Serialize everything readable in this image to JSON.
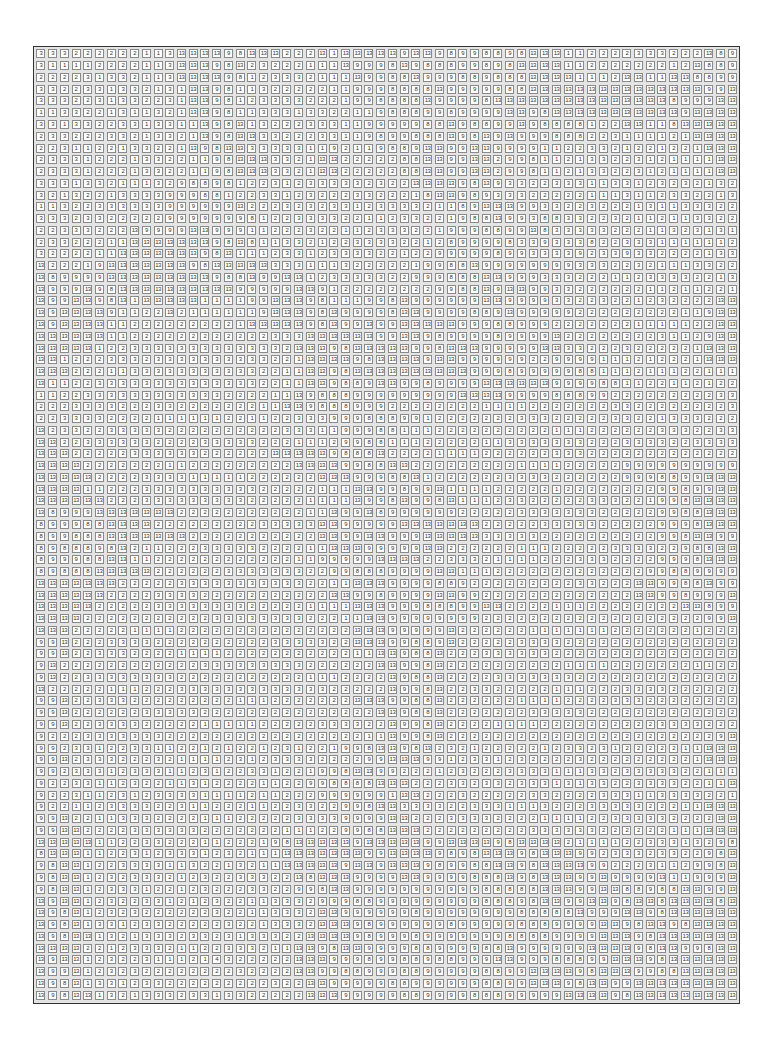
{
  "puzzle": {
    "type": "paint-by-number",
    "columns": 60,
    "rows": 81,
    "palette_numbers": [
      "1",
      "2",
      "3",
      "8",
      "9",
      "13"
    ],
    "grid_rows": [
      "3 3 3 2 2 2 2 2 2 1 1 3 13 13 13 13 9 8 13 13 13 2 2 2 13 1 13 13 13 13 13 9 13 13 9 8 9 9 8 8 9 8 13 13 13 1 1 2 2 2 2 3 3 3 2 2 2 13 8 9",
      "3 1 1 1 1 2 2 2 2 1 1 3 13 13 13 9 8 13 2 3 2 2 2 1 1 1 13 9 9 9 8 13 9 8 8 8 9 9 8 9 8 13 13 13 13 1 1 2 2 2 2 2 2 2 1 2 13 8 8 9",
      "2 2 2 2 3 1 3 3 2 1 1 3 13 13 13 13 9 8 1 2 3 3 3 2 1 1 1 13 9 9 8 8 13 9 9 9 8 8 9 8 8 8 13 13 13 13 1 1 1 2 13 13 1 1 13 13 8 8 9 9",
      "3 3 2 2 3 3 1 3 3 2 1 3 1 13 13 9 8 1 1 3 2 2 2 2 2 1 1 9 9 9 8 8 8 8 13 9 9 9 9 9 8 8 13 13 13 13 13 13 13 13 13 13 13 13 13 13 13 9 9 13",
      "3 3 3 2 2 3 1 3 3 2 2 3 1 13 13 9 8 1 2 3 3 3 3 2 2 2 1 9 9 8 8 8 8 13 9 9 9 9 8 13 13 13 13 13 13 13 13 13 13 13 13 13 13 13 8 9 9 9 13 13",
      "1 1 3 3 2 2 1 3 1 1 3 2 1 13 13 9 8 1 1 3 3 3 1 3 3 2 2 1 1 9 8 8 8 9 9 8 9 9 9 9 13 13 9 8 13 13 13 13 13 13 13 13 13 13 13 9 13 13 13 13",
      "3 3 1 3 3 2 2 3 3 1 3 3 1 1 13 9 8 13 1 3 2 2 2 3 3 3 1 1 9 9 9 9 9 8 8 13 9 8 8 9 9 13 9 8 8 8 8 1 2 2 13 13 1 1 8 13 13 13 13 13",
      "2 3 3 2 2 2 3 3 2 1 3 3 2 1 13 9 8 13 13 3 3 2 2 2 3 3 1 1 9 8 9 9 8 8 8 13 9 8 13 9 13 9 9 9 8 8 8 2 2 3 1 1 1 1 2 1 13 13 13 13",
      "2 2 3 1 1 2 2 1 3 3 2 2 1 13 9 8 13 13 3 3 3 3 3 1 1 9 2 1 1 9 8 8 9 13 13 9 9 13 13 9 9 9 9 1 1 2 2 3 3 2 1 2 2 1 2 2 1 13 13 13",
      "2 3 3 3 1 2 2 2 1 3 3 2 2 1 1 9 8 13 13 13 3 3 2 1 13 13 2 2 2 2 2 8 8 13 13 9 9 13 13 2 9 9 8 1 1 2 1 3 3 2 2 3 1 2 1 1 1 1 13 13",
      "2 3 3 3 1 2 2 2 1 3 3 2 2 1 1 9 8 13 13 13 3 3 2 1 13 13 2 2 2 2 2 8 8 13 13 9 9 13 13 2 9 9 8 1 1 2 1 3 3 2 2 3 1 2 1 1 1 1 13 13",
      "3 3 3 1 3 3 2 1 1 1 3 2 9 8 8 9 8 1 2 2 3 1 2 3 3 3 3 3 2 3 2 2 13 13 13 13 9 8 13 9 3 3 2 2 3 3 3 1 1 3 3 1 2 3 2 3 2 1 3 2",
      "3 2 1 3 2 2 1 3 3 3 3 9 9 9 8 8 1 2 2 3 3 1 2 3 2 2 2 3 3 2 2 2 1 8 13 13 9 8 9 3 3 3 2 2 2 2 2 1 1 1 3 1 1 2 3 3 2 2 1 3",
      "1 1 3 2 2 3 3 3 3 3 3 9 9 9 9 9 9 13 2 2 2 3 2 3 2 3 3 1 2 3 3 3 3 2 1 1 8 9 13 13 13 9 9 3 3 2 2 3 2 2 2 1 3 1 1 3 3 3 2 2",
      "3 3 3 2 3 3 2 2 2 2 2 9 9 9 9 9 9 9 8 1 2 2 3 3 3 3 2 2 1 1 2 3 3 2 2 1 9 8 8 13 9 9 3 8 8 3 3 2 2 3 2 1 1 2 1 1 3 3 2 2",
      "2 2 3 3 3 2 2 2 13 9 9 9 9 13 13 9 9 9 1 1 2 2 2 3 2 2 1 1 2 3 3 3 2 2 1 9 9 9 8 8 9 9 13 8 3 3 3 3 3 2 2 2 1 1 3 2 3 1 3 1",
      "2 3 3 2 2 2 1 1 13 13 13 13 13 13 13 9 8 13 8 1 1 3 3 2 1 2 2 3 3 3 3 2 2 1 2 8 9 9 9 9 8 3 3 9 3 3 3 8 2 2 3 3 3 1 1 1 1 1 1 2",
      "3 2 2 2 2 1 1 13 13 13 13 13 13 13 9 8 13 1 1 1 2 3 3 1 2 3 3 3 3 2 2 1 2 2 9 9 9 9 9 8 9 9 3 3 3 3 9 2 3 3 9 3 3 2 2 2 2 1 3 3",
      "13 2 2 2 1 9 13 13 13 13 13 13 13 9 8 13 13 13 13 13 3 3 3 1 1 1 3 2 2 2 2 2 1 9 9 8 8 13 9 9 9 9 9 9 9 9 3 3 3 2 2 3 2 1 1 1 3 3 2 2",
      "13 8 9 9 9 9 13 13 13 13 13 13 13 13 13 9 8 8 13 9 9 13 13 1 2 3 3 3 3 3 2 2 9 9 9 8 8 8 13 13 9 9 9 3 3 3 2 2 2 1 1 2 3 3 3 3 2 2 1 3",
      "13 9 9 9 13 9 8 13 13 13 13 13 13 13 13 13 13 9 9 9 9 9 13 13 9 1 2 2 2 2 2 2 2 2 9 9 8 8 13 9 13 13 9 9 3 3 2 2 2 2 2 2 1 1 2 1 1 2 2 1",
      "13 9 9 13 13 9 8 13 1 13 13 13 13 13 1 1 1 1 9 9 13 13 13 9 8 1 1 1 9 9 8 13 9 9 9 9 9 9 13 13 9 9 9 9 3 3 2 2 3 2 2 1 2 3 2 2 2 2 13 13",
      "13 9 13 13 13 13 9 1 1 2 2 13 2 1 1 1 1 1 1 9 13 13 13 9 8 13 9 9 9 9 8 13 13 9 9 9 9 8 8 9 13 9 9 9 9 9 2 2 2 2 2 2 2 2 2 1 1 9 13 13",
      "13 9 13 13 13 13 1 1 2 2 2 2 2 2 2 2 2 1 13 13 13 13 13 9 8 13 9 9 13 9 9 13 13 13 13 13 9 9 9 8 8 9 9 9 2 2 2 2 2 2 2 1 1 1 1 1 2 2 13 13",
      "13 13 13 13 13 13 1 1 2 2 2 2 2 2 2 2 2 2 2 2 3 3 3 13 13 13 13 13 13 9 9 13 13 9 8 9 9 9 9 8 9 9 9 9 13 2 2 2 2 2 2 2 2 3 1 1 2 9 13 13",
      "13 13 13 13 13 1 2 2 3 3 3 3 3 3 3 3 3 3 3 3 3 2 13 13 13 9 8 13 13 13 13 13 9 9 8 13 13 13 9 9 9 9 9 13 13 3 3 2 2 2 3 2 2 2 2 2 1 13 13 13",
      "13 13 1 2 2 2 3 3 3 2 3 3 3 3 3 3 3 3 3 3 2 2 1 13 13 13 13 9 8 13 13 13 13 9 13 13 9 9 9 9 9 9 2 2 9 9 9 9 1 1 1 2 1 2 2 2 1 13 13 13",
      "13 13 13 2 2 2 1 1 3 3 3 3 3 3 3 3 3 3 3 2 2 1 1 13 13 9 8 13 13 13 13 13 13 13 13 13 13 9 9 9 8 9 9 9 9 9 8 8 1 1 1 2 1 1 1 2 2 1 1 1",
      "13 1 1 2 2 3 3 3 3 3 3 3 3 3 3 3 3 3 3 2 2 1 1 13 13 9 8 8 9 13 13 9 9 8 9 9 9 9 13 13 13 13 13 13 9 9 9 9 8 8 1 1 2 2 1 1 2 1 2 2",
      "1 1 2 2 3 3 3 3 3 3 3 3 3 3 3 3 2 2 2 2 1 1 13 9 8 8 8 9 9 9 9 9 9 9 9 9 13 13 13 13 9 9 9 9 8 8 8 9 9 2 2 2 2 2 2 2 2 2 3 3",
      "2 2 2 3 3 3 3 2 2 2 3 3 2 2 2 2 2 2 2 1 1 13 13 9 8 8 8 9 9 9 2 2 2 2 2 2 2 2 1 1 1 1 2 2 2 2 2 2 2 3 3 2 2 2 2 2 2 2 2 3",
      "2 2 3 3 3 3 2 2 2 2 1 1 1 1 1 1 2 2 1 1 2 2 3 3 3 9 9 9 8 8 8 9 9 1 2 2 2 2 2 2 2 3 3 3 2 2 2 2 2 3 3 2 2 1 3 3 3 2 2 2",
      "13 2 3 3 2 2 3 3 3 3 3 2 2 2 2 2 2 2 2 2 2 3 3 3 1 1 9 9 9 8 8 1 1 1 2 2 2 2 2 2 2 2 2 2 1 1 1 2 2 2 2 2 2 3 3 3 2 2 3 3",
      "13 13 2 2 3 3 3 3 3 3 2 2 2 2 3 3 3 3 3 2 2 2 1 1 1 2 9 9 8 8 1 1 1 2 2 2 2 2 1 1 3 3 3 3 3 3 3 2 2 2 3 3 3 3 2 2 3 3 3 3",
      "13 13 13 2 2 2 2 2 3 3 3 3 3 3 2 2 2 2 2 2 13 13 13 13 13 9 8 8 8 13 2 2 2 2 1 1 1 1 2 2 2 2 2 2 3 3 3 2 2 2 2 2 2 2 2 2 2 2 2 2",
      "13 13 13 13 2 2 2 2 2 2 2 1 1 2 2 2 2 2 2 2 2 2 13 13 13 13 9 9 8 8 13 13 2 2 2 2 2 2 2 2 2 1 1 1 1 2 2 2 2 2 9 9 9 9 9 9 9 9 9 9",
      "13 13 13 13 13 2 2 2 2 3 3 3 3 1 1 1 1 1 2 2 2 2 2 2 13 13 13 9 9 9 8 8 13 1 2 2 2 2 2 2 3 3 3 3 2 2 2 2 2 2 9 9 9 8 8 9 9 13 13 13",
      "13 13 13 13 1 1 2 2 2 3 3 3 3 3 3 3 3 3 3 2 2 2 2 2 1 1 1 13 13 9 9 8 9 9 13 1 1 1 1 2 2 2 2 2 1 2 2 2 2 2 2 2 2 9 9 8 9 9 13 13",
      "13 13 13 13 13 13 2 2 2 3 3 3 3 3 3 3 3 3 2 2 2 2 2 1 1 1 1 13 9 9 8 13 9 9 8 13 1 1 1 2 3 3 2 2 2 2 2 3 3 3 2 2 1 9 9 8 13 13 13 13",
      "13 8 9 9 9 13 13 13 13 13 13 13 2 2 2 2 2 2 2 2 2 2 2 1 1 13 9 9 13 8 9 9 9 9 9 9 2 2 2 2 2 3 3 3 3 3 3 3 2 2 2 2 2 9 9 8 8 13 13 13",
      "8 9 9 9 8 8 13 13 13 13 2 2 2 2 2 2 2 2 2 3 3 3 3 3 13 13 9 9 9 9 9 13 13 13 13 13 13 13 2 2 2 2 2 3 3 3 3 3 2 2 2 2 2 9 9 9 8 13 13 13",
      "8 9 9 8 8 8 13 13 13 13 13 13 13 2 2 2 2 2 2 2 2 2 2 2 13 13 9 9 13 13 9 9 9 13 13 13 13 13 3 3 3 3 3 2 2 2 2 2 2 2 2 2 2 9 9 8 13 13 9 9",
      "8 9 8 8 8 9 8 13 2 1 1 2 2 2 3 3 3 3 3 2 2 2 2 1 1 13 13 13 9 9 9 9 9 13 13 2 2 2 2 2 2 1 1 1 2 2 2 2 2 3 3 3 3 2 2 9 8 8 13 13",
      "8 9 9 9 8 8 13 13 1 1 2 2 2 2 2 2 2 2 2 2 2 2 1 1 9 9 9 9 9 13 13 13 13 2 2 3 3 3 2 1 1 1 1 2 2 2 3 3 3 2 2 2 2 9 9 9 8 13 13 13",
      "8 9 8 8 8 13 13 13 13 13 2 2 2 2 2 2 3 3 3 3 3 3 3 2 2 9 9 8 8 8 9 9 9 9 13 13 1 1 1 2 2 2 2 2 2 2 2 2 2 2 2 2 9 9 8 8 9 9 9 9",
      "13 13 13 13 13 13 13 2 2 2 2 2 3 3 3 3 3 3 3 3 3 3 3 2 2 1 1 13 13 13 9 9 9 9 8 8 9 2 2 2 2 2 2 2 2 2 3 3 2 2 2 13 13 9 9 8 8 13 9 9",
      "13 13 13 13 13 13 2 2 2 2 3 3 3 3 2 2 2 2 2 2 2 2 2 2 2 13 13 9 9 8 9 9 9 9 13 13 9 9 2 2 2 2 2 2 2 2 2 2 2 2 2 13 13 9 9 8 9 9 9 13",
      "13 13 13 13 13 2 2 2 2 2 3 3 3 3 3 3 3 3 2 2 2 2 2 1 1 1 1 13 13 13 9 9 9 8 8 8 9 9 13 13 2 2 2 2 1 1 1 2 2 2 2 2 2 2 2 13 13 8 9 9",
      "13 13 13 13 2 2 2 2 2 2 2 2 2 2 2 3 3 3 3 3 3 3 3 2 2 2 1 1 13 13 9 9 9 9 9 9 9 9 2 2 2 2 2 2 2 2 2 2 2 2 2 2 2 2 2 2 2 9 9 13",
      "13 13 13 2 2 2 2 2 1 1 1 1 2 2 2 2 2 2 2 2 2 2 2 2 2 2 2 13 13 13 9 9 9 9 9 13 2 2 2 2 2 2 1 1 1 1 1 1 1 2 2 2 2 2 2 2 1 2 2 2",
      "9 9 13 2 2 2 3 3 3 3 2 2 2 2 2 2 2 2 2 2 3 3 3 3 3 2 2 13 13 13 9 9 8 8 9 13 2 2 2 2 2 3 3 3 3 2 2 2 2 2 2 2 2 2 2 2 2 2 2 2",
      "9 9 13 2 2 3 3 3 2 2 2 2 1 1 1 1 2 2 2 2 2 2 2 2 2 2 2 1 1 13 13 9 8 8 13 2 2 2 3 3 3 3 3 3 2 2 2 2 2 2 2 2 2 2 2 2 2 2 2 2",
      "9 13 2 2 2 2 2 2 2 2 2 2 2 2 3 3 3 3 3 3 3 3 3 2 2 2 2 2 2 13 13 9 9 8 13 2 2 2 2 2 2 2 2 2 2 1 1 1 1 2 2 2 2 2 2 2 1 1 2 2",
      "9 13 2 2 3 3 3 3 3 3 3 3 2 2 2 2 2 2 2 2 2 2 2 1 1 1 2 2 2 2 13 9 8 8 13 2 2 2 2 3 3 3 3 3 3 3 2 2 2 2 2 2 2 2 2 2 2 2 2 2",
      "13 2 2 2 2 2 1 1 1 2 2 2 3 3 3 3 3 3 3 3 3 3 3 3 3 2 2 2 2 2 13 9 9 8 13 2 2 3 3 2 2 2 2 2 1 1 1 2 2 2 3 3 3 3 2 2 2 2 2 2",
      "9 9 13 2 2 3 3 3 2 2 2 2 2 2 2 2 2 1 1 1 2 2 2 2 2 2 2 13 13 13 9 9 8 8 13 2 2 2 2 2 2 1 1 1 1 2 2 2 2 3 3 3 2 2 2 2 2 2 2 2",
      "9 9 13 2 2 2 2 2 2 3 3 3 3 3 2 2 2 2 2 2 2 2 2 2 2 2 2 2 2 13 13 9 8 8 13 2 2 2 2 2 2 2 3 3 3 3 3 2 2 2 2 2 2 2 2 2 2 2 2 2",
      "9 9 13 2 2 3 3 3 3 2 2 2 2 2 1 1 1 1 1 2 2 2 2 2 3 3 3 3 2 2 13 9 9 8 13 2 2 2 2 1 1 1 1 2 2 2 2 2 2 2 2 2 2 3 3 3 3 2 2 2",
      "9 2 2 2 3 3 3 3 3 3 3 2 2 2 2 2 2 2 2 2 2 2 2 2 2 2 2 2 1 1 13 9 9 8 13 2 2 2 2 2 2 2 2 2 2 2 2 2 2 2 2 2 2 2 2 2 2 2 9 13",
      "9 9 2 3 3 1 2 2 3 3 1 1 2 2 1 2 1 2 2 1 2 3 1 2 2 1 9 9 8 13 13 9 8 13 2 3 2 1 2 2 2 2 2 1 2 3 3 2 3 1 2 2 2 2 2 1 1 13 13 13",
      "9 9 13 2 3 3 3 2 2 2 3 2 1 1 1 1 2 3 1 2 3 3 3 3 2 2 2 2 9 9 13 13 13 9 9 1 2 3 3 1 2 3 2 2 2 2 3 2 2 2 2 2 2 2 2 2 1 13 13 13",
      "9 9 2 3 3 3 1 2 3 3 3 1 1 2 3 1 2 2 3 3 1 2 2 1 9 9 8 13 13 9 9 2 2 2 1 2 3 2 2 2 3 3 3 3 1 1 1 3 3 2 3 3 3 3 3 2 2 1 1 1",
      "9 2 2 3 3 1 1 2 3 2 2 1 1 3 1 2 2 2 2 1 1 2 2 9 9 8 8 8 8 13 13 13 2 2 2 3 3 2 3 3 2 3 3 3 1 3 1 3 3 2 2 3 3 3 3 2 2 1 1 13",
      "9 2 2 3 1 1 2 3 1 2 3 3 3 3 1 1 1 1 2 1 1 2 2 2 9 9 9 9 9 9 1 13 13 2 2 2 3 2 2 2 2 2 3 3 2 2 2 2 3 3 3 1 1 3 3 3 3 2 2 1",
      "9 2 2 1 1 2 3 3 3 3 2 2 3 1 1 2 2 2 1 1 2 2 3 3 2 2 9 9 8 13 13 3 3 3 3 2 2 3 3 3 1 1 1 3 2 2 2 3 3 3 3 3 2 2 2 1 1 13 13 13",
      "9 9 13 2 2 1 1 3 3 3 2 2 2 2 1 1 1 2 2 2 2 2 3 3 3 3 9 9 9 9 13 13 2 2 2 3 3 3 3 2 2 2 2 1 1 1 1 2 2 3 3 3 3 3 2 2 2 2 13 13",
      "9 9 13 13 2 2 2 2 3 3 3 3 3 3 2 2 2 2 2 2 2 1 1 1 2 2 9 9 8 8 13 13 13 2 2 2 2 2 2 2 2 2 3 3 3 3 3 3 2 2 2 2 2 2 1 1 1 13 13 13",
      "13 13 13 13 13 1 1 2 2 3 3 2 2 2 1 1 2 2 2 1 9 8 13 13 13 13 13 9 13 13 13 13 13 9 9 13 13 13 13 9 8 13 13 13 13 2 1 1 1 1 2 2 3 3 3 1 3 2 9 8",
      "8 13 13 13 1 1 2 2 3 1 2 3 3 3 1 2 3 2 1 1 1 13 13 13 13 13 13 13 9 9 13 13 13 13 9 8 9 8 13 13 13 9 8 13 13 13 9 9 2 3 3 3 2 3 3 2 2 9 8 13",
      "9 8 13 13 1 2 2 3 3 3 3 1 1 3 2 2 1 3 2 1 1 13 13 13 13 13 9 13 13 9 13 13 13 9 8 9 9 8 8 13 13 9 8 13 13 13 13 9 9 2 2 2 3 1 1 2 9 9 8 13",
      "9 8 13 13 1 2 3 2 3 3 3 2 1 2 3 2 2 3 3 3 2 2 13 8 13 13 13 9 9 9 9 13 13 9 9 9 9 8 8 8 13 9 8 13 13 13 9 9 13 9 9 9 9 13 1 1 9 9 9 13",
      "9 8 13 13 1 2 3 3 3 1 2 2 1 2 3 2 2 2 3 3 2 2 9 9 8 13 13 9 9 9 9 9 9 9 9 9 9 9 8 8 8 8 8 13 13 13 9 9 13 13 8 8 9 8 8 13 13 9 9 13",
      "13 9 13 13 1 2 3 2 2 3 3 1 2 1 2 3 2 2 1 1 3 3 3 2 9 9 9 8 8 9 9 9 9 9 9 9 9 9 8 8 8 9 8 13 13 9 9 13 13 9 8 13 13 8 13 13 13 13 8 13",
      "13 9 8 13 1 2 3 2 3 2 2 2 2 2 2 3 2 2 1 1 3 3 3 2 13 13 9 9 9 9 9 9 8 9 9 9 9 9 9 9 9 8 8 8 8 8 13 9 9 9 13 13 9 8 13 13 13 13 13 13",
      "13 9 8 13 1 3 3 1 2 3 3 2 2 2 2 2 3 2 2 1 3 3 3 2 13 13 13 9 8 9 9 9 9 9 9 8 9 9 9 9 9 8 8 8 9 9 9 9 13 13 9 8 13 13 9 8 13 13 13 13",
      "13 9 8 13 13 1 3 2 1 3 3 3 2 3 3 2 3 1 3 3 3 2 2 13 13 13 13 9 8 9 9 9 8 9 9 9 9 9 9 9 8 8 8 8 9 9 9 9 13 13 13 9 8 13 13 13 13 13 13 13",
      "13 13 13 13 2 2 1 2 3 3 3 2 1 1 2 2 3 3 3 2 1 1 13 13 9 8 13 13 9 9 9 9 8 8 9 9 9 9 8 8 13 9 9 9 9 9 9 13 13 13 13 9 8 13 13 9 9 8 13 13",
      "13 9 13 13 1 2 3 2 2 3 1 1 1 2 1 4 3 2 2 2 2 2 13 13 13 9 9 9 8 9 9 8 8 9 8 8 9 9 9 13 13 9 9 9 8 8 8 9 9 13 13 13 9 8 13 13 13 13 13 13",
      "13 9 9 13 1 2 3 2 3 2 2 2 2 2 2 2 2 3 2 2 2 2 13 13 9 9 8 8 9 9 9 8 8 9 9 9 9 9 8 8 9 9 13 13 13 13 9 8 13 13 13 9 9 8 8 13 13 13 13 13",
      "13 9 8 13 1 3 3 1 2 3 3 2 2 2 2 2 2 2 2 2 3 2 2 13 13 9 9 9 9 9 8 8 9 9 9 9 9 9 8 8 9 9 13 13 13 9 8 13 13 9 9 13 13 13 13 13 13 13 13 13",
      "13 9 8 13 13 1 3 2 1 3 3 3 2 3 3 1 3 3 2 2 2 2 2 13 13 13 9 9 9 9 9 8 8 9 9 9 9 8 8 8 9 9 9 9 9 13 13 13 13 9 8 13 13 13 13 13 13 13 13 13"
    ]
  }
}
